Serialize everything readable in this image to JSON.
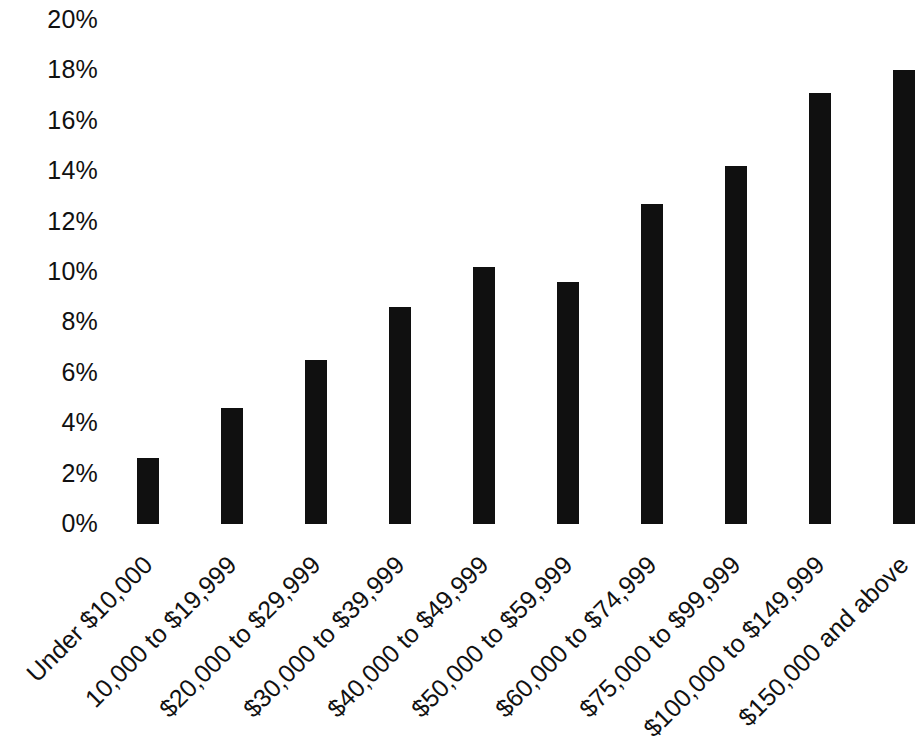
{
  "chart_data": {
    "type": "bar",
    "title": "",
    "subtitle": "",
    "xlabel": "",
    "ylabel": "",
    "categories": [
      "Under $10,000",
      "10,000 to $19,999",
      "$20,000 to $29,999",
      "$30,000 to $39,999",
      "$40,000 to $49,999",
      "$50,000 to $59,999",
      "$60,000 to $74,999",
      "$75,000 to $99,999",
      "$100,000 to $149,999",
      "$150,000 and above"
    ],
    "values": [
      2.6,
      4.6,
      6.5,
      8.6,
      10.2,
      9.6,
      12.7,
      14.2,
      17.1,
      18.0
    ],
    "ylim": [
      0,
      20
    ],
    "ytick_values": [
      0,
      2,
      4,
      6,
      8,
      10,
      12,
      14,
      16,
      18,
      20
    ],
    "ytick_labels": [
      "0%",
      "2%",
      "4%",
      "6%",
      "8%",
      "10%",
      "12%",
      "14%",
      "16%",
      "18%",
      "20%"
    ],
    "grid": false,
    "legend": null,
    "bar_color": "#101010",
    "background_color": "#ffffff",
    "text_color": "#111111",
    "xtick_rotation": -45,
    "last_bar_clipped": true
  }
}
